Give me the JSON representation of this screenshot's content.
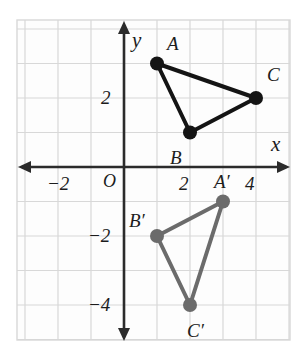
{
  "chart_data": {
    "type": "scatter",
    "title": "",
    "xlabel": "x",
    "ylabel": "y",
    "grid": true,
    "legend": "none",
    "xlim": [
      -3.2,
      5.0
    ],
    "ylim": [
      -5.0,
      4.3
    ],
    "origin_label": "O",
    "x_ticks": [
      {
        "value": -2,
        "label": "−2"
      },
      {
        "value": 2,
        "label": "2"
      },
      {
        "value": 4,
        "label": "4"
      }
    ],
    "y_ticks": [
      {
        "value": 2,
        "label": "2"
      },
      {
        "value": -2,
        "label": "−2"
      },
      {
        "value": -4,
        "label": "−4"
      }
    ],
    "series": [
      {
        "name": "triangle-abc",
        "color": "#141414",
        "closed": true,
        "points": [
          {
            "label": "A",
            "x": 1,
            "y": 3,
            "label_dx": 16,
            "label_dy": -21
          },
          {
            "label": "B",
            "x": 2,
            "y": 1,
            "label_dx": -14,
            "label_dy": 24
          },
          {
            "label": "C",
            "x": 4,
            "y": 2,
            "label_dx": 17,
            "label_dy": -24
          }
        ]
      },
      {
        "name": "triangle-a-prime-b-prime-c-prime",
        "color": "#6b6b6b",
        "closed": true,
        "points": [
          {
            "label": "A′",
            "x": 3,
            "y": -1,
            "label_dx": -3,
            "label_dy": -21
          },
          {
            "label": "B′",
            "x": 1,
            "y": -2,
            "label_dx": -22,
            "label_dy": -16
          },
          {
            "label": "C′",
            "x": 2,
            "y": -4,
            "label_dx": 3,
            "label_dy": 25
          }
        ]
      }
    ]
  },
  "style": {
    "grid_color": "#d8d8d8",
    "axis_color": "#2b2b2b",
    "plot_bg": "#fdfdfd",
    "text_color": "#1c1c1c"
  }
}
